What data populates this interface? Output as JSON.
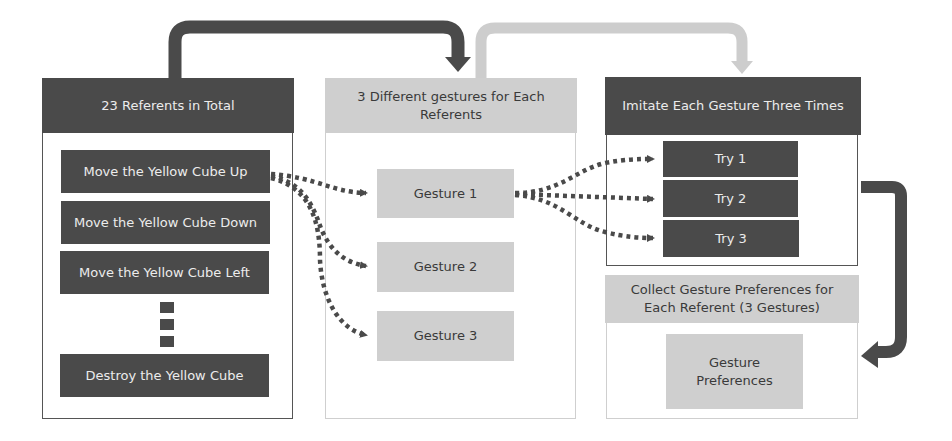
{
  "diagram": {
    "stage1": {
      "header": "23 Referents in Total",
      "items": [
        "Move the Yellow Cube Up",
        "Move the Yellow Cube Down",
        "Move the Yellow Cube Left",
        "Destroy the Yellow Cube"
      ],
      "ellipsis_count": 3
    },
    "stage2": {
      "header": "3 Different gestures for Each Referents",
      "items": [
        "Gesture 1",
        "Gesture 2",
        "Gesture 3"
      ]
    },
    "stage3": {
      "header": "Imitate Each Gesture Three Times",
      "items": [
        "Try 1",
        "Try 2",
        "Try 3"
      ]
    },
    "stage4": {
      "header": "Collect Gesture Preferences for Each Referent (3 Gestures)",
      "items": [
        "Gesture Preferences"
      ]
    },
    "colors": {
      "dark": "#4a4a4a",
      "light": "#cfcfcf",
      "dark_text": "#ececec",
      "light_text": "#3a3a3a",
      "arrow_dark": "#4a4a4a",
      "arrow_light": "#cdcdcd"
    }
  }
}
